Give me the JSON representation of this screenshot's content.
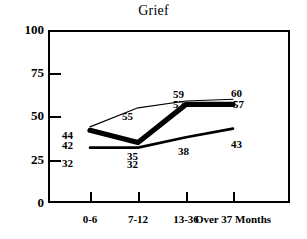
{
  "chart_data": {
    "type": "line",
    "title": "Grief",
    "xlabel": "",
    "ylabel": "",
    "categories": [
      "0-6",
      "7-12",
      "13-36",
      "Over 37 Months"
    ],
    "x_tick_labels": [
      "0-6",
      "7-12",
      "13-36",
      "Over 37 Months"
    ],
    "y_tick_labels": [
      "100",
      "75",
      "50",
      "25",
      "0"
    ],
    "y_ticks": [
      100,
      75,
      50,
      25,
      0
    ],
    "ylim": [
      0,
      100
    ],
    "grid": false,
    "legend": "none",
    "series": [
      {
        "name": "thin-line",
        "values": [
          44,
          55,
          59,
          60
        ],
        "labels": [
          "44",
          "55",
          "59",
          "60"
        ],
        "line_weight": "thin"
      },
      {
        "name": "thick-line",
        "values": [
          42,
          35,
          57,
          57
        ],
        "labels": [
          "42",
          "35",
          "57",
          "57"
        ],
        "line_weight": "thick"
      },
      {
        "name": "medium-line",
        "values": [
          32,
          32,
          38,
          43
        ],
        "labels": [
          "32",
          "32",
          "38",
          "43"
        ],
        "line_weight": "medium"
      }
    ],
    "colors": {
      "line": "#000000",
      "axis": "#000000",
      "background": "#ffffff",
      "text": "#000000"
    }
  },
  "point_labels": [
    {
      "text": "44",
      "x": 62,
      "y": 130
    },
    {
      "text": "42",
      "x": 62,
      "y": 140
    },
    {
      "text": "32",
      "x": 62,
      "y": 158
    },
    {
      "text": "55",
      "x": 122,
      "y": 111
    },
    {
      "text": "35",
      "x": 127,
      "y": 151
    },
    {
      "text": "32",
      "x": 127,
      "y": 159
    },
    {
      "text": "59",
      "x": 173,
      "y": 89
    },
    {
      "text": "57",
      "x": 173,
      "y": 99
    },
    {
      "text": "38",
      "x": 178,
      "y": 146
    },
    {
      "text": "60",
      "x": 231,
      "y": 88
    },
    {
      "text": "57",
      "x": 233,
      "y": 99
    },
    {
      "text": "43",
      "x": 231,
      "y": 139
    }
  ],
  "y_axis": {
    "ticks": [
      {
        "label": "100",
        "top": 30,
        "mark": false
      },
      {
        "label": "75",
        "top": 73,
        "mark": true
      },
      {
        "label": "50",
        "top": 116,
        "mark": true
      },
      {
        "label": "25",
        "top": 160,
        "mark": true
      },
      {
        "label": "0",
        "top": 203,
        "mark": false
      }
    ]
  },
  "x_axis": {
    "ticks": [
      {
        "label": "0-6",
        "x": 90
      },
      {
        "label": "7-12",
        "x": 138
      },
      {
        "label": "13-36",
        "x": 186
      },
      {
        "label": "Over 37 Months",
        "x": 233
      }
    ]
  }
}
